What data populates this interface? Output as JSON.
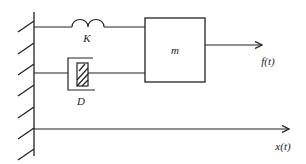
{
  "diagram": {
    "title": "",
    "type": "mass-spring-damper",
    "labels": {
      "spring": "K",
      "damper": "D",
      "mass": "m",
      "force": "f(t)",
      "displacement": "x(t)"
    },
    "colors": {
      "stroke": "#222222",
      "background": "#ffffff"
    },
    "components": [
      {
        "id": "wall",
        "kind": "fixed-wall",
        "hatched": true
      },
      {
        "id": "spring",
        "kind": "spring",
        "label": "K",
        "connects": [
          "wall",
          "mass"
        ]
      },
      {
        "id": "damper",
        "kind": "damper",
        "label": "D",
        "connects": [
          "wall",
          "mass"
        ]
      },
      {
        "id": "mass",
        "kind": "block",
        "label": "m"
      },
      {
        "id": "force",
        "kind": "arrow",
        "label": "f(t)",
        "from": "mass",
        "direction": "right"
      },
      {
        "id": "axis",
        "kind": "arrow",
        "label": "x(t)",
        "from": "wall",
        "direction": "right"
      }
    ]
  }
}
